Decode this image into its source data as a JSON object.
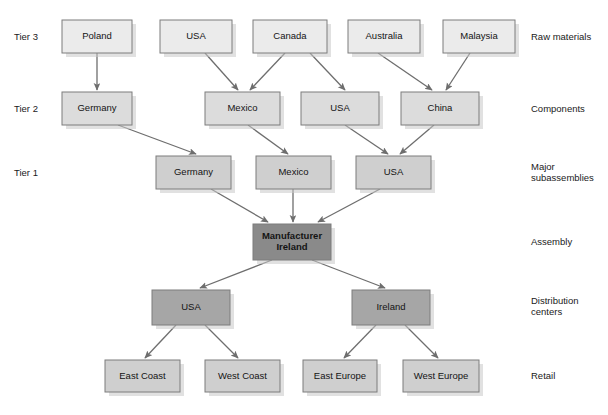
{
  "diagram": {
    "type": "flow-hierarchy",
    "background_color": "#ffffff",
    "arrow_color": "#6e6e6e",
    "border_color": "#7d7d7d",
    "fills": {
      "raw_materials": "#ebebeb",
      "components": "#dcdcdc",
      "major_subassemblies": "#cfcfcf",
      "assembly": "#8a8a8a",
      "distribution": "#a6a6a6",
      "retail": "#cfcfcf"
    }
  },
  "tier_labels": [
    {
      "text": "Tier 3",
      "x": 14,
      "y": 37
    },
    {
      "text": "Tier 2",
      "x": 14,
      "y": 109
    },
    {
      "text": "Tier 1",
      "x": 14,
      "y": 173
    }
  ],
  "stage_labels": [
    {
      "text": "Raw materials",
      "x": 531,
      "y": 37,
      "lines": [
        "Raw materials"
      ]
    },
    {
      "text": "Components",
      "x": 531,
      "y": 109,
      "lines": [
        "Components"
      ]
    },
    {
      "text": "Major subassemblies",
      "x": 531,
      "y": 173,
      "lines": [
        "Major",
        "subassemblies"
      ]
    },
    {
      "text": "Assembly",
      "x": 531,
      "y": 242,
      "lines": [
        "Assembly"
      ]
    },
    {
      "text": "Distribution centers",
      "x": 531,
      "y": 307,
      "lines": [
        "Distribution",
        "centers"
      ]
    },
    {
      "text": "Retail",
      "x": 531,
      "y": 376,
      "lines": [
        "Retail"
      ]
    }
  ],
  "nodes": [
    {
      "id": "t3-poland",
      "label": "Poland",
      "x": 62,
      "y": 20,
      "w": 70,
      "h": 33,
      "fill": "#ebebeb",
      "row": "raw_materials",
      "emphasis": false
    },
    {
      "id": "t3-usa",
      "label": "USA",
      "x": 160,
      "y": 20,
      "w": 72,
      "h": 33,
      "fill": "#ebebeb",
      "row": "raw_materials",
      "emphasis": false
    },
    {
      "id": "t3-canada",
      "label": "Canada",
      "x": 253,
      "y": 20,
      "w": 74,
      "h": 33,
      "fill": "#ebebeb",
      "row": "raw_materials",
      "emphasis": false
    },
    {
      "id": "t3-australia",
      "label": "Australia",
      "x": 348,
      "y": 20,
      "w": 72,
      "h": 33,
      "fill": "#ebebeb",
      "row": "raw_materials",
      "emphasis": false
    },
    {
      "id": "t3-malaysia",
      "label": "Malaysia",
      "x": 443,
      "y": 20,
      "w": 72,
      "h": 33,
      "fill": "#ebebeb",
      "row": "raw_materials",
      "emphasis": false
    },
    {
      "id": "t2-germany",
      "label": "Germany",
      "x": 62,
      "y": 92,
      "w": 70,
      "h": 33,
      "fill": "#dcdcdc",
      "row": "components",
      "emphasis": false
    },
    {
      "id": "t2-mexico",
      "label": "Mexico",
      "x": 205,
      "y": 92,
      "w": 75,
      "h": 33,
      "fill": "#dcdcdc",
      "row": "components",
      "emphasis": false
    },
    {
      "id": "t2-usa",
      "label": "USA",
      "x": 301,
      "y": 92,
      "w": 78,
      "h": 33,
      "fill": "#dcdcdc",
      "row": "components",
      "emphasis": false
    },
    {
      "id": "t2-china",
      "label": "China",
      "x": 401,
      "y": 92,
      "w": 78,
      "h": 33,
      "fill": "#dcdcdc",
      "row": "components",
      "emphasis": false
    },
    {
      "id": "t1-germany",
      "label": "Germany",
      "x": 156,
      "y": 156,
      "w": 75,
      "h": 33,
      "fill": "#cfcfcf",
      "row": "major_subassemblies",
      "emphasis": false
    },
    {
      "id": "t1-mexico",
      "label": "Mexico",
      "x": 256,
      "y": 156,
      "w": 75,
      "h": 33,
      "fill": "#cfcfcf",
      "row": "major_subassemblies",
      "emphasis": false
    },
    {
      "id": "t1-usa",
      "label": "USA",
      "x": 356,
      "y": 156,
      "w": 75,
      "h": 33,
      "fill": "#cfcfcf",
      "row": "major_subassemblies",
      "emphasis": false
    },
    {
      "id": "assembly-ireland",
      "label": "Manufacturer\nIreland",
      "x": 253,
      "y": 224,
      "w": 78,
      "h": 36,
      "fill": "#8a8a8a",
      "row": "assembly",
      "emphasis": true
    },
    {
      "id": "dc-usa",
      "label": "USA",
      "x": 152,
      "y": 290,
      "w": 78,
      "h": 35,
      "fill": "#a6a6a6",
      "row": "distribution",
      "emphasis": false
    },
    {
      "id": "dc-ireland",
      "label": "Ireland",
      "x": 352,
      "y": 290,
      "w": 78,
      "h": 35,
      "fill": "#a6a6a6",
      "row": "distribution",
      "emphasis": false
    },
    {
      "id": "retail-east-coast",
      "label": "East Coast",
      "x": 105,
      "y": 360,
      "w": 75,
      "h": 32,
      "fill": "#cfcfcf",
      "row": "retail",
      "emphasis": false
    },
    {
      "id": "retail-west-coast",
      "label": "West Coast",
      "x": 205,
      "y": 360,
      "w": 75,
      "h": 32,
      "fill": "#cfcfcf",
      "row": "retail",
      "emphasis": false
    },
    {
      "id": "retail-east-europe",
      "label": "East Europe",
      "x": 303,
      "y": 360,
      "w": 74,
      "h": 32,
      "fill": "#cfcfcf",
      "row": "retail",
      "emphasis": false
    },
    {
      "id": "retail-west-europe",
      "label": "West Europe",
      "x": 403,
      "y": 360,
      "w": 76,
      "h": 32,
      "fill": "#cfcfcf",
      "row": "retail",
      "emphasis": false
    }
  ],
  "links": [
    {
      "from": "t3-poland",
      "to": "t2-germany",
      "x1": 97,
      "y1": 53,
      "x2": 97,
      "y2": 90
    },
    {
      "from": "t3-usa",
      "to": "t2-mexico",
      "x1": 205,
      "y1": 53,
      "x2": 238,
      "y2": 90
    },
    {
      "from": "t3-canada",
      "to": "t2-mexico",
      "x1": 285,
      "y1": 53,
      "x2": 250,
      "y2": 90
    },
    {
      "from": "t3-canada",
      "to": "t2-usa",
      "x1": 310,
      "y1": 53,
      "x2": 345,
      "y2": 90
    },
    {
      "from": "t3-australia",
      "to": "t2-china",
      "x1": 378,
      "y1": 53,
      "x2": 432,
      "y2": 90
    },
    {
      "from": "t3-malaysia",
      "to": "t2-china",
      "x1": 470,
      "y1": 53,
      "x2": 446,
      "y2": 90
    },
    {
      "from": "t2-germany",
      "to": "t1-germany",
      "x1": 118,
      "y1": 125,
      "x2": 196,
      "y2": 154
    },
    {
      "from": "t2-mexico",
      "to": "t1-mexico",
      "x1": 248,
      "y1": 125,
      "x2": 288,
      "y2": 154
    },
    {
      "from": "t2-usa",
      "to": "t1-usa",
      "x1": 345,
      "y1": 125,
      "x2": 388,
      "y2": 154
    },
    {
      "from": "t2-china",
      "to": "t1-usa",
      "x1": 434,
      "y1": 125,
      "x2": 400,
      "y2": 154
    },
    {
      "from": "t1-germany",
      "to": "assembly-ireland",
      "x1": 211,
      "y1": 189,
      "x2": 268,
      "y2": 222
    },
    {
      "from": "t1-mexico",
      "to": "assembly-ireland",
      "x1": 293,
      "y1": 189,
      "x2": 293,
      "y2": 222
    },
    {
      "from": "t1-usa",
      "to": "assembly-ireland",
      "x1": 380,
      "y1": 189,
      "x2": 318,
      "y2": 222
    },
    {
      "from": "assembly-ireland",
      "to": "dc-usa",
      "x1": 272,
      "y1": 260,
      "x2": 200,
      "y2": 288
    },
    {
      "from": "assembly-ireland",
      "to": "dc-ireland",
      "x1": 312,
      "y1": 260,
      "x2": 385,
      "y2": 288
    },
    {
      "from": "dc-usa",
      "to": "retail-east-coast",
      "x1": 176,
      "y1": 325,
      "x2": 145,
      "y2": 358
    },
    {
      "from": "dc-usa",
      "to": "retail-west-coast",
      "x1": 205,
      "y1": 325,
      "x2": 238,
      "y2": 358
    },
    {
      "from": "dc-ireland",
      "to": "retail-east-europe",
      "x1": 376,
      "y1": 325,
      "x2": 344,
      "y2": 358
    },
    {
      "from": "dc-ireland",
      "to": "retail-west-europe",
      "x1": 405,
      "y1": 325,
      "x2": 438,
      "y2": 358
    }
  ]
}
